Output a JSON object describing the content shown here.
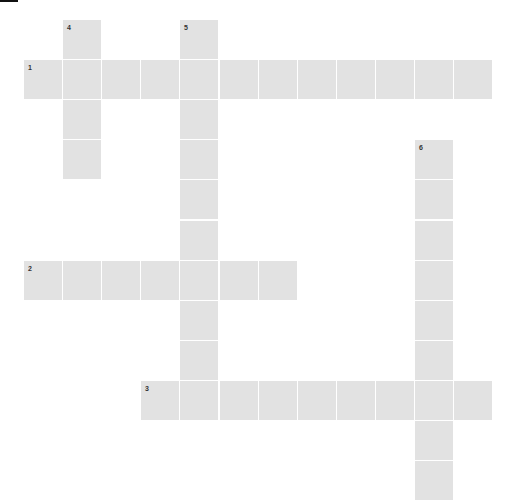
{
  "puzzle": {
    "cell_color": "#e2e2e2",
    "background_color": "#ffffff",
    "number_color": "#333333",
    "origin": {
      "x": 24,
      "y": 20
    },
    "pitch": {
      "x": 39.1,
      "y": 40.1
    },
    "cell_size": {
      "w": 38,
      "h": 39
    },
    "words": [
      {
        "number": "1",
        "direction": "across",
        "row": 1,
        "col": 0,
        "length": 12
      },
      {
        "number": "2",
        "direction": "across",
        "row": 6,
        "col": 0,
        "length": 7
      },
      {
        "number": "3",
        "direction": "across",
        "row": 9,
        "col": 3,
        "length": 9
      },
      {
        "number": "4",
        "direction": "down",
        "row": 0,
        "col": 1,
        "length": 4
      },
      {
        "number": "5",
        "direction": "down",
        "row": 0,
        "col": 4,
        "length": 10
      },
      {
        "number": "6",
        "direction": "down",
        "row": 3,
        "col": 10,
        "length": 9
      }
    ]
  }
}
